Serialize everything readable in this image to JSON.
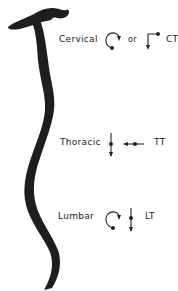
{
  "diagram": {
    "type": "spine-motion-diagram",
    "colors": {
      "spine": "#1e1e1e",
      "text": "#222222",
      "symbols": "#222222",
      "background": "#ffffff"
    },
    "regions": [
      {
        "name": "Cervical",
        "symbols": [
          "rotation-arrow-icon",
          "translation-corner-arrow-icon"
        ],
        "connector": "or",
        "code": "CT"
      },
      {
        "name": "Thoracic",
        "symbols": [
          "vertical-translation-arrow-icon",
          "horizontal-translation-arrow-icon"
        ],
        "code": "TT"
      },
      {
        "name": "Lumbar",
        "symbols": [
          "rotation-arrow-icon",
          "vertical-translation-arrow-icon"
        ],
        "code": "LT"
      }
    ]
  }
}
